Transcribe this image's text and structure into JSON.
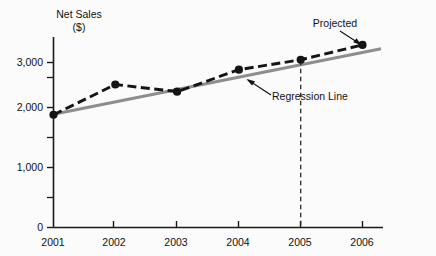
{
  "chart_data": {
    "type": "line",
    "title": "Net Sales ($)",
    "title_line1": "Net Sales",
    "title_line2": "($)",
    "xlabel": "",
    "ylabel": "Net Sales ($)",
    "categories": [
      "2001",
      "2002",
      "2003",
      "2004",
      "2005",
      "2006"
    ],
    "x": [
      2001,
      2002,
      2003,
      2004,
      2005,
      2006
    ],
    "xlim": [
      2001,
      2006
    ],
    "ylim": [
      0,
      3300
    ],
    "yticks": [
      0,
      1000,
      2000,
      3000
    ],
    "ytick_labels": [
      "0",
      "1,000",
      "2,000",
      "3,000"
    ],
    "yticks_minor": [
      500,
      1500,
      2500
    ],
    "grid": false,
    "legend_position": "none",
    "series": [
      {
        "name": "Net Sales",
        "style": "dashed-with-markers",
        "color": "#141414",
        "values": [
          2050,
          2600,
          2470,
          2870,
          3050,
          3320
        ]
      },
      {
        "name": "Regression Line",
        "style": "solid",
        "color": "#8e8e8e",
        "x": [
          2001,
          2006.3
        ],
        "values": [
          2060,
          3250
        ]
      }
    ],
    "annotations": [
      {
        "name": "projected-label",
        "text": "Projected",
        "points_to": {
          "x": 2006,
          "y": 3320
        }
      },
      {
        "name": "regression-line-label",
        "text": "Regression Line",
        "points_to": {
          "x": 2004.2,
          "y": 2880
        }
      },
      {
        "name": "projection-divider",
        "text": "",
        "at_x": 2005
      }
    ]
  },
  "colors": {
    "data_line": "#141414",
    "regression_line": "#8e8e8e",
    "axis": "#1a1a1a",
    "background": "#fbfbfb",
    "text": "#111111"
  }
}
